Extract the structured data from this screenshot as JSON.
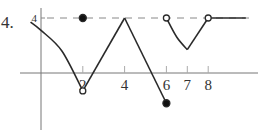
{
  "problem": {
    "number_label": "4."
  },
  "chart_data": {
    "type": "line",
    "title": "",
    "xlabel": "",
    "ylabel": "",
    "xlim": [
      -1,
      10
    ],
    "ylim": [
      -3,
      4.5
    ],
    "grid": false,
    "x_ticks": [
      {
        "value": 2,
        "label": "2"
      },
      {
        "value": 4,
        "label": "4"
      },
      {
        "value": 6,
        "label": "6"
      },
      {
        "value": 7,
        "label": "7"
      },
      {
        "value": 8,
        "label": "8"
      }
    ],
    "y_ticks": [
      {
        "value": 4,
        "label": "4"
      }
    ],
    "reference_lines": [
      {
        "orientation": "horizontal",
        "y": 4,
        "style": "dashed"
      }
    ],
    "series": [
      {
        "name": "segment-1-curve",
        "style": "solid",
        "curve": true,
        "points": [
          [
            -0.5,
            3.7
          ],
          [
            0,
            3.1
          ],
          [
            1,
            1.6
          ],
          [
            2,
            -1.3
          ]
        ]
      },
      {
        "name": "segment-2-line-up",
        "style": "solid",
        "points": [
          [
            2,
            -1.3
          ],
          [
            4,
            4
          ]
        ]
      },
      {
        "name": "segment-3-line-down",
        "style": "solid",
        "points": [
          [
            4,
            4
          ],
          [
            6,
            -2.2
          ]
        ]
      },
      {
        "name": "segment-4-curve",
        "style": "solid",
        "curve": true,
        "points": [
          [
            6,
            4
          ],
          [
            6.5,
            2.6
          ],
          [
            7,
            1.7
          ]
        ]
      },
      {
        "name": "segment-5-line-up",
        "style": "solid",
        "points": [
          [
            7,
            1.7
          ],
          [
            8,
            4
          ]
        ]
      },
      {
        "name": "segment-6-flat",
        "style": "solid",
        "points": [
          [
            8,
            4
          ],
          [
            9.8,
            4
          ]
        ]
      }
    ],
    "markers": [
      {
        "name": "filled-dot-2-4",
        "x": 2,
        "y": 4,
        "filled": true
      },
      {
        "name": "open-circle-2-low",
        "x": 2,
        "y": -1.3,
        "filled": false
      },
      {
        "name": "filled-dot-6-low",
        "x": 6,
        "y": -2.2,
        "filled": true
      },
      {
        "name": "open-circle-6-4",
        "x": 6,
        "y": 4,
        "filled": false
      },
      {
        "name": "open-circle-8-4",
        "x": 8,
        "y": 4,
        "filled": false
      }
    ]
  }
}
